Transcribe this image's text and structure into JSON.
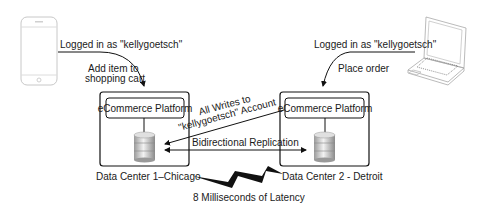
{
  "diagram": {
    "clients": {
      "mobile": {
        "icon": "smartphone-icon",
        "login_label": "Logged in as  \"kellygoetsch\"",
        "action_label_line1": "Add item to",
        "action_label_line2": "shopping cart"
      },
      "laptop": {
        "icon": "laptop-icon",
        "login_label": "Logged in as  \"kellygoetsch\"",
        "action_label": "Place order"
      }
    },
    "data_centers": [
      {
        "name": "Data Center 1–Chicago",
        "platform_label": "eCommerce Platform",
        "icon": "database-icon"
      },
      {
        "name": "Data Center 2 - Detroit",
        "platform_label": "eCommerce Platform",
        "icon": "database-icon"
      }
    ],
    "links": {
      "writes_line1": "All Writes to",
      "writes_line2": "\"kellygoetsch\" Account",
      "replication": "Bidirectional Replication",
      "latency": "8 Milliseconds of Latency",
      "latency_icon": "lightning-bolt-icon"
    }
  }
}
